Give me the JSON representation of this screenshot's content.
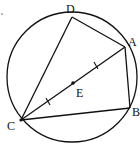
{
  "diagram": {
    "type": "geometry",
    "circle": {
      "cx": 72,
      "cy": 77,
      "r": 65
    },
    "points": {
      "A": {
        "label": "A",
        "x": 125,
        "y": 47,
        "lx": 128,
        "ly": 46
      },
      "B": {
        "label": "B",
        "x": 130,
        "y": 108,
        "lx": 132,
        "ly": 116
      },
      "C": {
        "label": "C",
        "x": 21,
        "y": 120,
        "lx": 7,
        "ly": 130
      },
      "D": {
        "label": "D",
        "x": 72,
        "y": 17,
        "lx": 66,
        "ly": 13
      },
      "E": {
        "label": "E",
        "x": 73,
        "y": 83,
        "lx": 76,
        "ly": 97
      }
    },
    "segments": [
      "AD",
      "DC",
      "CA",
      "AB",
      "BC"
    ],
    "equal_marks": [
      "AE",
      "EC"
    ],
    "stray_dot": {
      "x": 2,
      "y": 14
    }
  }
}
